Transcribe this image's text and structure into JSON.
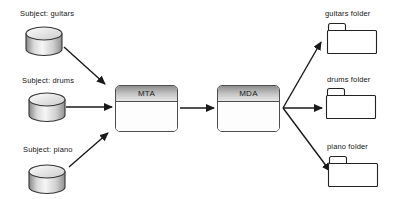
{
  "subjects": [
    {
      "label": "Subject: guitars"
    },
    {
      "label": "Subject: drums"
    },
    {
      "label": "Subject: piano"
    }
  ],
  "processors": [
    {
      "label": "MTA"
    },
    {
      "label": "MDA"
    }
  ],
  "folders": [
    {
      "label": "guitars folder"
    },
    {
      "label": "drums folder"
    },
    {
      "label": "piano folder"
    }
  ],
  "colors": {
    "line": "#1a1a1a",
    "box_border": "#4d4d4d",
    "box_header_top": "#8e8e8e",
    "box_header_bottom": "#e7e7e7",
    "box_body": "#fdfdfd",
    "background": "#ffffff"
  }
}
